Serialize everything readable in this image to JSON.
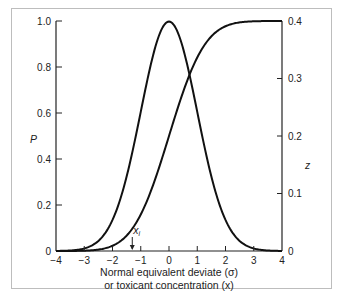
{
  "chart_data": {
    "type": "line",
    "title": "",
    "xlabel_line1": "Normal equivalent deviate (σ)",
    "xlabel_line2": "or toxicant concentration (x)",
    "ylabel_left": "P",
    "ylabel_right": "z",
    "xlim": [
      -4,
      4
    ],
    "ylim_left": [
      0,
      1.0
    ],
    "ylim_right": [
      0,
      0.4
    ],
    "x_ticks": [
      "-4",
      "-3",
      "-2",
      "-1",
      "0",
      "1",
      "2",
      "3",
      "4"
    ],
    "x_tick_values": [
      -4,
      -3,
      -2,
      -1,
      0,
      1,
      2,
      3,
      4
    ],
    "y_left_ticks": [
      "0",
      "0.2",
      "0.4",
      "0.6",
      "0.8",
      "1.0"
    ],
    "y_left_tick_values": [
      0,
      0.2,
      0.4,
      0.6,
      0.8,
      1.0
    ],
    "y_right_ticks": [
      "0",
      "0.1",
      "0.2",
      "0.3",
      "0.4"
    ],
    "y_right_tick_values": [
      0,
      0.1,
      0.2,
      0.3,
      0.4
    ],
    "grid": false,
    "series": [
      {
        "name": "Normal density z (right axis)",
        "axis": "right",
        "kind": "normal_pdf",
        "mean": 0,
        "sd": 1,
        "x": [
          -4,
          -3.5,
          -3,
          -2.5,
          -2,
          -1.5,
          -1,
          -0.5,
          0,
          0.5,
          1,
          1.5,
          2,
          2.5,
          3,
          3.5,
          4
        ],
        "values": [
          0.0001,
          0.0009,
          0.0044,
          0.0175,
          0.054,
          0.1295,
          0.242,
          0.3521,
          0.3989,
          0.3521,
          0.242,
          0.1295,
          0.054,
          0.0175,
          0.0044,
          0.0009,
          0.0001
        ]
      },
      {
        "name": "Cumulative probability P (left axis)",
        "axis": "left",
        "kind": "normal_cdf",
        "mean": 0,
        "sd": 1,
        "x": [
          -4,
          -3.5,
          -3,
          -2.5,
          -2,
          -1.5,
          -1,
          -0.5,
          0,
          0.5,
          1,
          1.5,
          2,
          2.5,
          3,
          3.5,
          4
        ],
        "values": [
          0.0,
          0.0002,
          0.0013,
          0.0062,
          0.0228,
          0.0668,
          0.1587,
          0.3085,
          0.5,
          0.6915,
          0.8413,
          0.9332,
          0.9772,
          0.9938,
          0.9987,
          0.9998,
          1.0
        ]
      }
    ],
    "annotations": [
      {
        "text": "x",
        "subscript": "i",
        "x": -1.3,
        "arrow": "down"
      }
    ]
  }
}
